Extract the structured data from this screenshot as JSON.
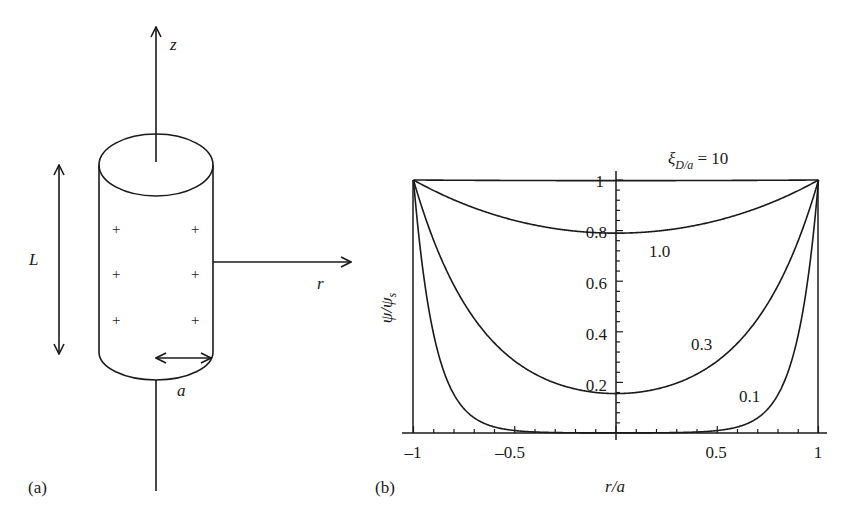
{
  "panel_a": {
    "label": "(a)",
    "z_label": "z",
    "r_label": "r",
    "L_label": "L",
    "a_label": "a",
    "charge_symbol": "+"
  },
  "panel_b": {
    "label": "(b)",
    "xlabel": "r/a",
    "ylabel_main": "ψ/ψ",
    "ylabel_sub": "s",
    "param_symbol": "ξ",
    "param_sub": "D/a",
    "param_eq": " = 10",
    "x_ticks": [
      "–1",
      "–0.5",
      "0.5",
      "1"
    ],
    "y_ticks": [
      "1",
      "0.8",
      "0.6",
      "0.4",
      "0.2"
    ],
    "curve_labels": [
      "1.0",
      "0.3",
      "0.1"
    ]
  },
  "chart_data": {
    "type": "line",
    "title": "",
    "xlabel": "r/a",
    "ylabel": "ψ/ψs",
    "xlim": [
      -1,
      1
    ],
    "ylim": [
      0,
      1
    ],
    "x_ticks": [
      -1,
      -0.5,
      0.5,
      1
    ],
    "y_ticks": [
      0.2,
      0.4,
      0.6,
      0.8,
      1
    ],
    "grid": false,
    "legend": "inline curve labels",
    "series": [
      {
        "name": "ξD/a = 10",
        "xi": 10,
        "x": [
          -1,
          -0.5,
          0,
          0.5,
          1
        ],
        "values": [
          1.0,
          0.998,
          0.998,
          0.998,
          1.0
        ]
      },
      {
        "name": "ξD/a = 1.0",
        "xi": 1.0,
        "x": [
          -1,
          -0.5,
          0,
          0.5,
          1
        ],
        "values": [
          1.0,
          0.84,
          0.79,
          0.84,
          1.0
        ]
      },
      {
        "name": "ξD/a = 0.3",
        "xi": 0.3,
        "x": [
          -1,
          -0.5,
          0,
          0.5,
          1
        ],
        "values": [
          1.0,
          0.3,
          0.14,
          0.3,
          1.0
        ]
      },
      {
        "name": "ξD/a = 0.1",
        "xi": 0.1,
        "x": [
          -1,
          -0.5,
          0,
          0.5,
          1
        ],
        "values": [
          1.0,
          0.0,
          0.0,
          0.0,
          1.0
        ]
      }
    ]
  }
}
